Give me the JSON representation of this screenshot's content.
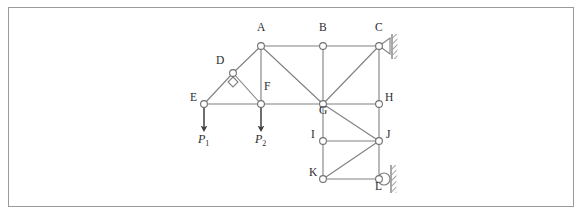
{
  "figure": {
    "type": "truss-structure-diagram",
    "border_color": "#9a9a9a",
    "background_color": "#ffffff",
    "member_color": "#808080",
    "node_fill": "#ffffff",
    "node_stroke": "#707070",
    "arrow_color": "#4a4a4a",
    "hatch_color": "#8a8a8a"
  },
  "nodes": [
    {
      "id": "A",
      "label": "A",
      "x": 260,
      "y": 45,
      "label_dx": -4,
      "label_dy": -16
    },
    {
      "id": "B",
      "label": "B",
      "x": 322,
      "y": 45,
      "label_dx": -4,
      "label_dy": -16
    },
    {
      "id": "C",
      "label": "C",
      "x": 378,
      "y": 45,
      "label_dx": -4,
      "label_dy": -16
    },
    {
      "id": "D",
      "label": "D",
      "x": 232,
      "y": 72,
      "label_dx": -17,
      "label_dy": -10
    },
    {
      "id": "E",
      "label": "E",
      "x": 203,
      "y": 103,
      "label_dx": -14,
      "label_dy": -4
    },
    {
      "id": "F",
      "label": "F",
      "x": 260,
      "y": 103,
      "label_dx": 3,
      "label_dy": -15
    },
    {
      "id": "G",
      "label": "G",
      "x": 322,
      "y": 103,
      "label_dx": -4,
      "label_dy": 9
    },
    {
      "id": "H",
      "label": "H",
      "x": 378,
      "y": 103,
      "label_dx": 6,
      "label_dy": -4
    },
    {
      "id": "I",
      "label": "I",
      "x": 322,
      "y": 140,
      "label_dx": -12,
      "label_dy": -4
    },
    {
      "id": "J",
      "label": "J",
      "x": 378,
      "y": 140,
      "label_dx": 7,
      "label_dy": -4
    },
    {
      "id": "K",
      "label": "K",
      "x": 322,
      "y": 178,
      "label_dx": -14,
      "label_dy": -4
    },
    {
      "id": "L",
      "label": "L",
      "x": 378,
      "y": 178,
      "label_dx": -4,
      "label_dy": 10
    }
  ],
  "members": [
    {
      "from": "A",
      "to": "B"
    },
    {
      "from": "B",
      "to": "C"
    },
    {
      "from": "A",
      "to": "D"
    },
    {
      "from": "D",
      "to": "E"
    },
    {
      "from": "D",
      "to": "F"
    },
    {
      "from": "A",
      "to": "F"
    },
    {
      "from": "A",
      "to": "G"
    },
    {
      "from": "E",
      "to": "F"
    },
    {
      "from": "F",
      "to": "G"
    },
    {
      "from": "B",
      "to": "G"
    },
    {
      "from": "C",
      "to": "G"
    },
    {
      "from": "C",
      "to": "H"
    },
    {
      "from": "G",
      "to": "H"
    },
    {
      "from": "G",
      "to": "I"
    },
    {
      "from": "G",
      "to": "J"
    },
    {
      "from": "H",
      "to": "J"
    },
    {
      "from": "I",
      "to": "J"
    },
    {
      "from": "I",
      "to": "K"
    },
    {
      "from": "J",
      "to": "K"
    },
    {
      "from": "J",
      "to": "L"
    },
    {
      "from": "K",
      "to": "L"
    }
  ],
  "right_angle_marker": {
    "at": "D",
    "size": 5,
    "offset_y": 9
  },
  "loads": [
    {
      "id": "P1",
      "at": "E",
      "label": "P",
      "subscript": "1",
      "x": 203,
      "y_start": 103,
      "y_end": 128,
      "label_x": 197,
      "label_y": 132
    },
    {
      "id": "P2",
      "at": "F",
      "label": "P",
      "subscript": "2",
      "x": 260,
      "y_start": 103,
      "y_end": 128,
      "label_x": 254,
      "label_y": 132
    }
  ],
  "supports": [
    {
      "id": "support-C",
      "type": "pin",
      "at": "C",
      "x": 378,
      "y": 45,
      "triangle_width": 11,
      "triangle_half_height": 8,
      "wall_x": 391,
      "wall_top": 33,
      "wall_bottom": 58
    },
    {
      "id": "support-L",
      "type": "roller",
      "at": "L",
      "x": 378,
      "y": 178,
      "roller_radius": 6,
      "wall_x": 390,
      "wall_top": 164,
      "wall_bottom": 192
    }
  ]
}
